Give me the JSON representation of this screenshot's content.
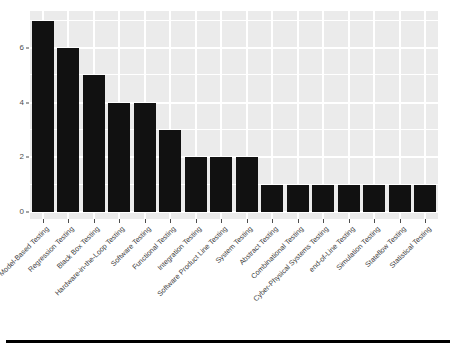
{
  "chart_data": {
    "type": "bar",
    "title": "",
    "subtitle": "",
    "xlabel": "",
    "ylabel": "",
    "ylim": [
      0,
      7.35
    ],
    "y_ticks": [
      0,
      2,
      4,
      6
    ],
    "y_minor_ticks": [
      1,
      3,
      5,
      7
    ],
    "grid": true,
    "legend": "none",
    "panel_background": "#ebebeb",
    "gridline_color": "#ffffff",
    "bar_color": "#111111",
    "axis_text_color": "#4d4d4d",
    "categories": [
      "Model-Based Testing",
      "Regression Testing",
      "Black Box Testing",
      "Hardware-in-the-Loop Testing",
      "Software Testing",
      "Functional Testing",
      "Integration Testing",
      "Software Product Line Testing",
      "System Testing",
      "Abstract Testing",
      "Combinational Testing",
      "Cyber-Physical Systems Testing",
      "end-of-Line Testing",
      "Simulation Testing",
      "Stateflow Testing",
      "Statistical Testing"
    ],
    "values": [
      7,
      6,
      5,
      4,
      4,
      3,
      2,
      2,
      2,
      1,
      1,
      1,
      1,
      1,
      1,
      1
    ]
  }
}
